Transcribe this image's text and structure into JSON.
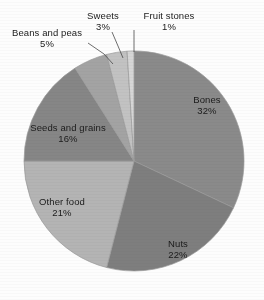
{
  "chart_data": {
    "type": "pie",
    "title": "",
    "subtitle": "",
    "xlabel": "",
    "ylabel": "",
    "legend_position": "none",
    "grid": false,
    "labels_show_percent": true,
    "start_angle_deg": 0,
    "direction": "clockwise",
    "categories": [
      "Bones",
      "Nuts",
      "Other food",
      "Seeds and grains",
      "Beans and peas",
      "Sweets",
      "Fruit stones"
    ],
    "values": [
      32,
      22,
      21,
      16,
      5,
      3,
      1
    ],
    "units": "percent",
    "slices": [
      {
        "label": "Bones",
        "value": 32,
        "value_text": "32%",
        "color": "#8a8a8a"
      },
      {
        "label": "Nuts",
        "value": 22,
        "value_text": "22%",
        "color": "#7e7e7e"
      },
      {
        "label": "Other food",
        "value": 21,
        "value_text": "21%",
        "color": "#b4b4b4"
      },
      {
        "label": "Seeds and grains",
        "value": 16,
        "value_text": "16%",
        "color": "#868686"
      },
      {
        "label": "Beans and peas",
        "value": 5,
        "value_text": "5%",
        "color": "#a3a3a3"
      },
      {
        "label": "Sweets",
        "value": 3,
        "value_text": "3%",
        "color": "#c2c2c2"
      },
      {
        "label": "Fruit stones",
        "value": 1,
        "value_text": "1%",
        "color": "#d6d6d6"
      }
    ]
  },
  "labels": {
    "bones": {
      "name": "Bones",
      "value": "32%"
    },
    "nuts": {
      "name": "Nuts",
      "value": "22%"
    },
    "other_food": {
      "name": "Other food",
      "value": "21%"
    },
    "seeds": {
      "name": "Seeds and grains",
      "value": "16%"
    },
    "beans": {
      "name": "Beans and peas",
      "value": "5%"
    },
    "sweets": {
      "name": "Sweets",
      "value": "3%"
    },
    "fruit_stones": {
      "name": "Fruit stones",
      "value": "1%"
    }
  },
  "geometry": {
    "center_x": 134,
    "center_y": 161,
    "radius": 110
  },
  "colors": {
    "background": "#ffffff",
    "text": "#1b1b1b",
    "outline": "#9a9a9a",
    "leader_line": "#4a4a4a"
  }
}
